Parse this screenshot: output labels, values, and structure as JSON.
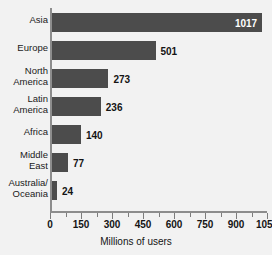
{
  "chart_data": {
    "type": "bar",
    "orientation": "horizontal",
    "title": "",
    "xlabel": "Millions of users",
    "ylabel": "",
    "xlim": [
      0,
      1050
    ],
    "grid": false,
    "legend": null,
    "bar_color": "#4c4c4c",
    "background_color": "#f2f2f2",
    "inside_label_color": "#ffffff",
    "outside_label_color": "#141414",
    "categories": [
      "Asia",
      "Europe",
      "North\nAmerica",
      "Latin\nAmerica",
      "Africa",
      "Middle\nEast",
      "Australia/\nOceania"
    ],
    "values": [
      1017,
      501,
      273,
      236,
      140,
      77,
      24
    ],
    "value_labels": [
      "1017",
      "501",
      "273",
      "236",
      "140",
      "77",
      "24"
    ],
    "label_placement": [
      "inside",
      "outside",
      "outside",
      "outside",
      "outside",
      "outside",
      "outside"
    ],
    "xticks": [
      0,
      150,
      300,
      450,
      600,
      750,
      900,
      1050
    ],
    "xtick_labels": [
      "0",
      "150",
      "300",
      "450",
      "600",
      "750",
      "900",
      "1050"
    ],
    "xminor_ticks": [
      75,
      225,
      375,
      525,
      675,
      825,
      975
    ]
  }
}
